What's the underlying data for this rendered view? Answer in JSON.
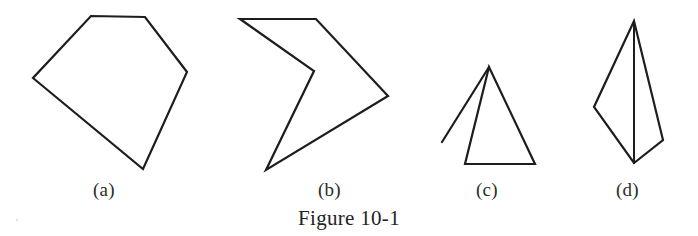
{
  "figure": {
    "caption": "Figure 10-1",
    "background_color": "#ffffff",
    "stroke_color": "#1d1d1d",
    "stroke_width": 2.2
  },
  "labels": {
    "a": "(a)",
    "b": "(b)",
    "c": "(c)",
    "d": "(d)"
  },
  "shapes": [
    {
      "id": "shape-a",
      "label": "(a)",
      "kind": "closed-polygon",
      "description": "convex pentagon",
      "closed": true,
      "points": "91,16 145,17 187,72 143,169 33,78"
    },
    {
      "id": "shape-b",
      "label": "(b)",
      "kind": "closed-polygon",
      "description": "non-convex arrow / chevron with reflex vertex",
      "closed": true,
      "points": "240,19 316,19 388,96 266,170 314,71"
    },
    {
      "id": "shape-c",
      "label": "(c)",
      "kind": "open-figure",
      "description": "triangle with extra open line segment from apex",
      "closed": false,
      "triangle_points": "489,67 465,164 535,164",
      "tail_points": "489,67 442,142"
    },
    {
      "id": "shape-d",
      "label": "(d)",
      "kind": "closed-polygon-with-chord",
      "description": "kite quadrilateral with internal vertical segment apex to apex",
      "closed": true,
      "points": "634,21 663,140 634,163 594,107",
      "chord_points": "634,21 634,163"
    }
  ]
}
